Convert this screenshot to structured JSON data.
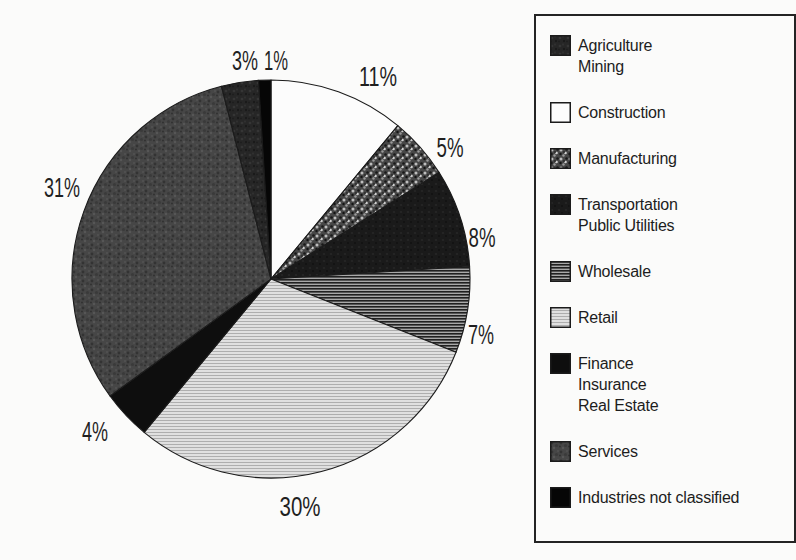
{
  "page": {
    "background": "#fbfbfa",
    "ink": "#1f1f1f"
  },
  "chart_data": {
    "type": "pie",
    "title": "",
    "start_angle_deg": 0,
    "direction": "clockwise",
    "units": "percent",
    "legend_position": "right",
    "segments": [
      {
        "label": "Construction",
        "value": 11,
        "pct_label": "11%",
        "pattern": "construction",
        "texture": "white"
      },
      {
        "label": "Manufacturing",
        "value": 5,
        "pct_label": "5%",
        "pattern": "manufacturing",
        "texture": "coarse-speckle"
      },
      {
        "label": "Transportation Public Utilities",
        "value": 8,
        "pct_label": "8%",
        "pattern": "transportation",
        "texture": "near-black"
      },
      {
        "label": "Wholesale",
        "value": 7,
        "pct_label": "7%",
        "pattern": "wholesale",
        "texture": "dark-horizontal-lines"
      },
      {
        "label": "Retail",
        "value": 30,
        "pct_label": "30%",
        "pattern": "retail",
        "texture": "light-horizontal-lines"
      },
      {
        "label": "Finance Insurance Real Estate",
        "value": 4,
        "pct_label": "4%",
        "pattern": "finance",
        "texture": "solid-black"
      },
      {
        "label": "Services",
        "value": 31,
        "pct_label": "31%",
        "pattern": "services",
        "texture": "dark-mottle"
      },
      {
        "label": "Agriculture Mining",
        "value": 3,
        "pct_label": "3%",
        "pattern": "agriculture",
        "texture": "darker-mottle"
      },
      {
        "label": "Industries not classified",
        "value": 1,
        "pct_label": "1%",
        "pattern": "industries",
        "texture": "solid-black"
      }
    ]
  },
  "legend": {
    "items": [
      {
        "pattern": "agriculture",
        "lines": [
          "Agriculture",
          "Mining"
        ]
      },
      {
        "pattern": "construction",
        "lines": [
          "Construction"
        ]
      },
      {
        "pattern": "manufacturing",
        "lines": [
          "Manufacturing"
        ]
      },
      {
        "pattern": "transportation",
        "lines": [
          "Transportation",
          "Public Utilities"
        ]
      },
      {
        "pattern": "wholesale",
        "lines": [
          "Wholesale"
        ]
      },
      {
        "pattern": "retail",
        "lines": [
          "Retail"
        ]
      },
      {
        "pattern": "finance",
        "lines": [
          "Finance",
          "Insurance",
          "Real Estate"
        ]
      },
      {
        "pattern": "services",
        "lines": [
          "Services"
        ]
      },
      {
        "pattern": "industries",
        "lines": [
          "Industries not classified"
        ]
      }
    ]
  }
}
